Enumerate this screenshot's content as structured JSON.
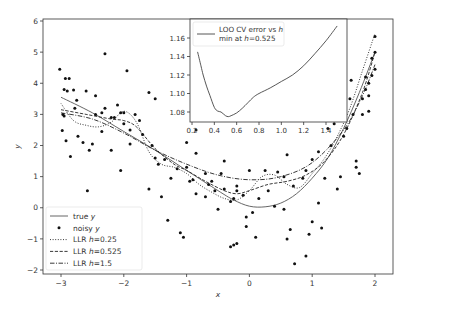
{
  "chart_data": [
    {
      "type": "scatter",
      "title": "",
      "xlabel": "x",
      "ylabel": "y",
      "xlim": [
        -3.3,
        2.3
      ],
      "ylim": [
        -2.1,
        6.05
      ],
      "xticks": [
        -3,
        -2,
        -1,
        0,
        1,
        2
      ],
      "xtick_labels": [
        "−3",
        "−2",
        "−1",
        "0",
        "1",
        "2"
      ],
      "yticks": [
        -2,
        -1,
        0,
        1,
        2,
        3,
        4,
        5,
        6
      ],
      "ytick_labels": [
        "−2",
        "−1",
        "0",
        "1",
        "2",
        "3",
        "4",
        "5",
        "6"
      ],
      "grid": false,
      "legend_position": "lower left",
      "legend": [
        {
          "label_pre": "true ",
          "label_it": "y",
          "label_post": "",
          "style": "solid"
        },
        {
          "label_pre": "noisy ",
          "label_it": "y",
          "label_post": "",
          "style": "dot-marker"
        },
        {
          "label_pre": "LLR ",
          "label_it": "h",
          "label_post": "=0.25",
          "style": "dotted"
        },
        {
          "label_pre": "LLR ",
          "label_it": "h",
          "label_post": "=0.525",
          "style": "dashed"
        },
        {
          "label_pre": "LLR ",
          "label_it": "h",
          "label_post": "=1.5",
          "style": "dashdot"
        }
      ],
      "series": [
        {
          "name": "true y",
          "style": "solid",
          "x": [
            -3.0,
            -2.5,
            -2.0,
            -1.5,
            -1.0,
            -0.5,
            -0.25,
            0.0,
            0.25,
            0.5,
            0.75,
            1.0,
            1.25,
            1.5,
            1.75,
            2.0
          ],
          "y": [
            3.55,
            3.05,
            2.45,
            1.85,
            1.2,
            0.55,
            0.25,
            0.05,
            0.03,
            0.15,
            0.45,
            0.95,
            1.6,
            2.55,
            3.7,
            5.0
          ]
        },
        {
          "name": "LLR h=0.25",
          "style": "dotted",
          "x": [
            -3.0,
            -2.8,
            -2.6,
            -2.4,
            -2.2,
            -2.0,
            -1.8,
            -1.6,
            -1.4,
            -1.2,
            -1.0,
            -0.8,
            -0.6,
            -0.4,
            -0.2,
            0.0,
            0.2,
            0.4,
            0.6,
            0.8,
            1.0,
            1.2,
            1.4,
            1.6,
            1.8,
            2.0
          ],
          "y": [
            3.35,
            2.8,
            2.65,
            2.6,
            2.75,
            3.1,
            2.75,
            1.8,
            1.4,
            1.3,
            1.1,
            0.75,
            0.5,
            0.3,
            0.25,
            0.55,
            1.0,
            1.05,
            0.75,
            0.65,
            1.1,
            1.6,
            2.3,
            3.2,
            4.4,
            5.6
          ]
        },
        {
          "name": "LLR h=0.525",
          "style": "dashed",
          "x": [
            -3.0,
            -2.6,
            -2.2,
            -2.0,
            -1.8,
            -1.5,
            -1.2,
            -1.0,
            -0.7,
            -0.4,
            -0.2,
            0.0,
            0.3,
            0.6,
            0.9,
            1.2,
            1.5,
            1.8,
            2.0
          ],
          "y": [
            3.15,
            3.0,
            2.85,
            2.8,
            2.6,
            1.9,
            1.4,
            1.2,
            0.85,
            0.55,
            0.45,
            0.55,
            0.75,
            0.85,
            1.05,
            1.5,
            2.35,
            3.7,
            5.0
          ]
        },
        {
          "name": "LLR h=1.5",
          "style": "dashdot",
          "x": [
            -3.0,
            -2.5,
            -2.0,
            -1.5,
            -1.0,
            -0.5,
            0.0,
            0.5,
            1.0,
            1.5,
            1.8,
            2.0
          ],
          "y": [
            3.05,
            2.85,
            2.4,
            1.85,
            1.4,
            1.05,
            0.9,
            1.0,
            1.45,
            2.5,
            3.6,
            4.6
          ]
        },
        {
          "name": "noisy y",
          "style": "markers",
          "points": [
            [
              -3.02,
              4.45
            ],
            [
              -2.93,
              4.15
            ],
            [
              -2.87,
              4.15
            ],
            [
              -2.95,
              3.8
            ],
            [
              -2.9,
              3.75
            ],
            [
              -2.8,
              3.78
            ],
            [
              -2.6,
              3.75
            ],
            [
              -2.45,
              3.6
            ],
            [
              -2.75,
              3.45
            ],
            [
              -2.78,
              3.2
            ],
            [
              -2.97,
              3.0
            ],
            [
              -2.95,
              2.95
            ],
            [
              -2.98,
              2.48
            ],
            [
              -2.92,
              2.15
            ],
            [
              -2.73,
              2.3
            ],
            [
              -2.65,
              2.1
            ],
            [
              -2.55,
              1.85
            ],
            [
              -2.5,
              2.05
            ],
            [
              -2.35,
              2.45
            ],
            [
              -2.45,
              3.0
            ],
            [
              -2.3,
              3.2
            ],
            [
              -2.2,
              2.9
            ],
            [
              -2.1,
              3.3
            ],
            [
              -2.15,
              2.9
            ],
            [
              -2.05,
              3.05
            ],
            [
              -2.0,
              3.05
            ],
            [
              -1.95,
              4.4
            ],
            [
              -2.3,
              4.95
            ],
            [
              -2.0,
              2.7
            ],
            [
              -1.9,
              2.05
            ],
            [
              -2.2,
              1.85
            ],
            [
              -2.05,
              1.2
            ],
            [
              -2.58,
              0.55
            ],
            [
              -2.85,
              1.65
            ],
            [
              -2.35,
              3.05
            ],
            [
              -1.6,
              3.7
            ],
            [
              -1.5,
              3.5
            ],
            [
              -1.82,
              3.0
            ],
            [
              -1.75,
              2.8
            ],
            [
              -1.9,
              2.5
            ],
            [
              -1.7,
              2.35
            ],
            [
              -1.55,
              2.0
            ],
            [
              -1.5,
              1.6
            ],
            [
              -1.35,
              1.55
            ],
            [
              -1.45,
              1.4
            ],
            [
              -1.25,
              0.95
            ],
            [
              -1.4,
              0.35
            ],
            [
              -1.15,
              1.25
            ],
            [
              -1.0,
              1.3
            ],
            [
              -0.95,
              0.85
            ],
            [
              -0.9,
              0.9
            ],
            [
              -0.85,
              1.75
            ],
            [
              -0.85,
              0.45
            ],
            [
              -1.3,
              -0.4
            ],
            [
              -1.1,
              -0.8
            ],
            [
              -1.05,
              -0.95
            ],
            [
              -0.85,
              2.5
            ],
            [
              -0.55,
              0.55
            ],
            [
              -0.5,
              -0.05
            ],
            [
              -0.45,
              1.1
            ],
            [
              -0.4,
              0.6
            ],
            [
              -0.3,
              0.2
            ],
            [
              -0.25,
              0.3
            ],
            [
              -0.2,
              0.7
            ],
            [
              -0.2,
              0.55
            ],
            [
              -0.1,
              0.4
            ],
            [
              -0.05,
              -0.3
            ],
            [
              -0.05,
              -0.6
            ],
            [
              -0.3,
              -1.25
            ],
            [
              -0.25,
              -1.2
            ],
            [
              -0.2,
              -1.15
            ],
            [
              0.05,
              -0.15
            ],
            [
              0.1,
              -0.95
            ],
            [
              0.25,
              1.2
            ],
            [
              0.4,
              0.05
            ],
            [
              0.55,
              -0.05
            ],
            [
              0.65,
              -0.7
            ],
            [
              0.72,
              -1.8
            ],
            [
              0.6,
              -1.0
            ],
            [
              0.9,
              -1.55
            ],
            [
              1.0,
              -0.45
            ],
            [
              1.1,
              0.15
            ],
            [
              1.15,
              -0.65
            ],
            [
              1.2,
              0.95
            ],
            [
              1.45,
              1.0
            ],
            [
              1.4,
              0.6
            ],
            [
              1.5,
              2.3
            ],
            [
              1.55,
              2.55
            ],
            [
              1.65,
              3.0
            ],
            [
              1.7,
              1.5
            ],
            [
              1.7,
              1.3
            ],
            [
              1.75,
              1.1
            ],
            [
              1.8,
              3.0
            ],
            [
              1.85,
              4.2
            ],
            [
              1.9,
              3.1
            ],
            [
              1.9,
              3.6
            ],
            [
              1.95,
              4.8
            ],
            [
              2.0,
              5.5
            ],
            [
              2.0,
              4.45
            ],
            [
              1.95,
              4.25
            ],
            [
              1.8,
              3.5
            ],
            [
              1.62,
              4.1
            ],
            [
              1.35,
              2.7
            ],
            [
              1.25,
              2.55
            ],
            [
              1.3,
              2.0
            ],
            [
              1.1,
              1.8
            ],
            [
              1.0,
              1.55
            ],
            [
              0.9,
              1.2
            ],
            [
              0.85,
              0.95
            ],
            [
              0.7,
              0.7
            ],
            [
              0.6,
              1.7
            ],
            [
              0.55,
              1.0
            ],
            [
              0.45,
              1.15
            ],
            [
              0.3,
              0.55
            ],
            [
              0.15,
              0.3
            ],
            [
              0.0,
              1.2
            ],
            [
              -0.65,
              0.75
            ],
            [
              -0.7,
              0.35
            ],
            [
              -0.6,
              0.85
            ],
            [
              -1.0,
              2.1
            ],
            [
              -0.7,
              1.1
            ],
            [
              -0.4,
              1.5
            ],
            [
              -1.6,
              0.6
            ],
            [
              0.95,
              -0.85
            ],
            [
              1.6,
              3.5
            ],
            [
              1.85,
              3.8
            ],
            [
              2.0,
              5.0
            ],
            [
              1.9,
              4.0
            ]
          ]
        }
      ]
    },
    {
      "type": "line",
      "title": "",
      "xlabel": "",
      "ylabel": "",
      "xlim": [
        0.18,
        1.55
      ],
      "ylim": [
        1.07,
        1.175
      ],
      "xticks": [
        0.2,
        0.4,
        0.6,
        0.8,
        1.0,
        1.2,
        1.4
      ],
      "xtick_labels": [
        "0.2",
        "0.4",
        "0.6",
        "0.8",
        "1.0",
        "1.2",
        "1.4"
      ],
      "yticks": [
        1.08,
        1.1,
        1.12,
        1.14,
        1.16
      ],
      "ytick_labels": [
        "1.08",
        "1.10",
        "1.12",
        "1.14",
        "1.16"
      ],
      "legend_position": "upper left",
      "legend": [
        {
          "line1_pre": "LOO CV error vs ",
          "line1_it": "h",
          "line2_pre": "min at ",
          "line2_it": "h",
          "line2_post": "=0.525"
        }
      ],
      "series": [
        {
          "name": "LOO CV error vs h",
          "x": [
            0.25,
            0.28,
            0.3,
            0.33,
            0.36,
            0.4,
            0.43,
            0.46,
            0.5,
            0.525,
            0.55,
            0.6,
            0.65,
            0.7,
            0.75,
            0.8,
            0.9,
            1.0,
            1.1,
            1.2,
            1.3,
            1.4,
            1.5
          ],
          "y": [
            1.145,
            1.13,
            1.12,
            1.108,
            1.098,
            1.085,
            1.081,
            1.08,
            1.076,
            1.075,
            1.076,
            1.079,
            1.084,
            1.09,
            1.096,
            1.1,
            1.106,
            1.113,
            1.12,
            1.13,
            1.143,
            1.157,
            1.173
          ]
        }
      ]
    }
  ]
}
